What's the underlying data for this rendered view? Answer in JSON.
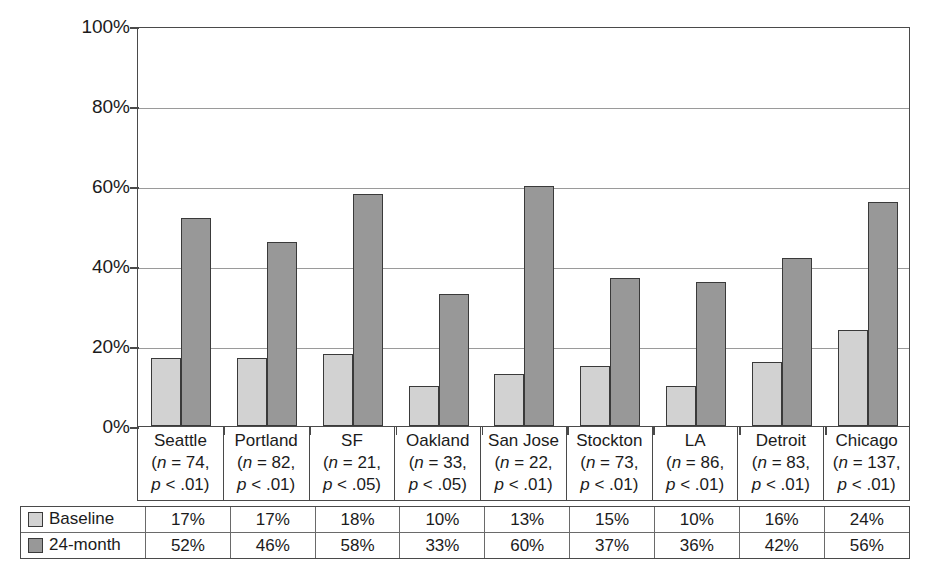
{
  "chart_data": {
    "type": "bar",
    "title": "",
    "xlabel": "",
    "ylabel": "",
    "ylim": [
      0,
      100
    ],
    "yticks": [
      "0%",
      "20%",
      "40%",
      "60%",
      "80%",
      "100%"
    ],
    "ytick_values": [
      0,
      20,
      40,
      60,
      80,
      100
    ],
    "grid": true,
    "legend_position": "table-left",
    "categories": [
      "Seattle",
      "Portland",
      "SF",
      "Oakland",
      "San Jose",
      "Stockton",
      "LA",
      "Detroit",
      "Chicago"
    ],
    "category_stats": [
      {
        "n": "(n = 74,",
        "p": "p < .01)"
      },
      {
        "n": "(n = 82,",
        "p": "p < .01)"
      },
      {
        "n": "(n = 21,",
        "p": "p < .05)"
      },
      {
        "n": "(n = 33,",
        "p": "p < .05)"
      },
      {
        "n": "(n = 22,",
        "p": "p < .01)"
      },
      {
        "n": "(n = 73,",
        "p": "p < .01)"
      },
      {
        "n": "(n = 86,",
        "p": "p < .01)"
      },
      {
        "n": "(n = 83,",
        "p": "p < .01)"
      },
      {
        "n": "(n = 137,",
        "p": "p < .01)"
      }
    ],
    "series": [
      {
        "name": "Baseline",
        "color": "#d2d2d2",
        "values": [
          17,
          17,
          18,
          10,
          13,
          15,
          10,
          16,
          24
        ],
        "labels": [
          "17%",
          "17%",
          "18%",
          "10%",
          "13%",
          "15%",
          "10%",
          "16%",
          "24%"
        ]
      },
      {
        "name": "24-month",
        "color": "#989898",
        "values": [
          52,
          46,
          58,
          33,
          60,
          37,
          36,
          42,
          56
        ],
        "labels": [
          "52%",
          "46%",
          "58%",
          "33%",
          "60%",
          "37%",
          "36%",
          "42%",
          "56%"
        ]
      }
    ]
  },
  "colors": {
    "baseline": "#d2d2d2",
    "month24": "#989898",
    "axis": "#4a4a4a",
    "grid": "#9a9a9a",
    "text": "#1b1b1b"
  }
}
